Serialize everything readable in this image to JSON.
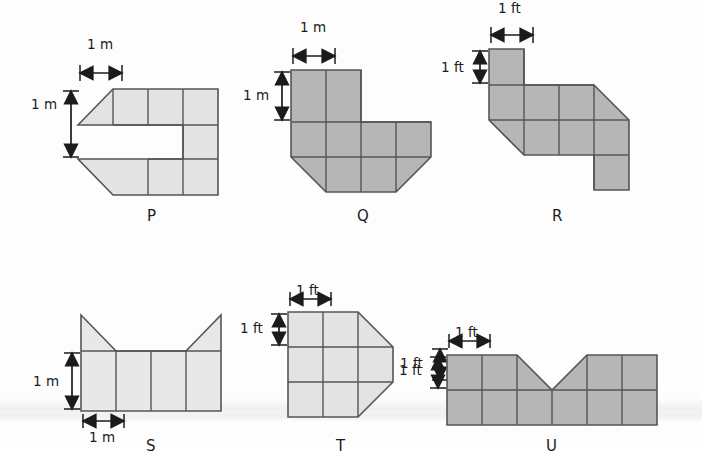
{
  "page": {
    "kind": "geometry-worksheet-figure",
    "background_color": "#fdfdfd",
    "fill_light": "#e3e3e3",
    "fill_dark": "#b6b6b6",
    "stroke_color": "#555555",
    "text_color": "#1b1b1b"
  },
  "figures": [
    {
      "id": "P",
      "label": "P",
      "unit": "m",
      "fill": "#e3e3e3",
      "dimensions": [
        {
          "name": "width",
          "text": "1 m"
        },
        {
          "name": "height",
          "text": "1 m"
        }
      ],
      "description": "Z-shaped polyomino: top row of 3 squares with a right triangle on the left end, a middle row of 2 squares on the right, and a bottom row of 3 squares with a right triangle on the left end."
    },
    {
      "id": "Q",
      "label": "Q",
      "unit": "m",
      "fill": "#b6b6b6",
      "dimensions": [
        {
          "name": "width",
          "text": "1 m"
        },
        {
          "name": "height",
          "text": "1 m"
        }
      ],
      "description": "Top row of 2 squares, middle row of 4 squares, bottom row of 2 squares with corner triangles cut on both lower ends."
    },
    {
      "id": "R",
      "label": "R",
      "unit": "ft",
      "fill": "#b6b6b6",
      "dimensions": [
        {
          "name": "width",
          "text": "1 ft"
        },
        {
          "name": "height",
          "text": "1 ft"
        }
      ],
      "description": "One square at top left, a row of 3 squares with a triangle on the right, a third row of 3 squares with a triangle cut at the left, and one square hanging below at the right."
    },
    {
      "id": "S",
      "label": "S",
      "unit": "m",
      "fill": "#e3e3e3",
      "dimensions": [
        {
          "name": "height",
          "text": "1 m"
        },
        {
          "name": "width",
          "text": "1 m"
        }
      ],
      "description": "A row of 4 squares with a right triangle pointing up on the first square and a right triangle pointing up on the last square."
    },
    {
      "id": "T",
      "label": "T",
      "unit": "ft",
      "fill": "#e3e3e3",
      "dimensions": [
        {
          "name": "width",
          "text": "1 ft"
        },
        {
          "name": "height",
          "text": "1 ft"
        },
        {
          "name": "right",
          "text": "1 ft"
        }
      ],
      "description": "A 3 by 3 grid of squares whose right edge bulges outward into a point across the middle row."
    },
    {
      "id": "U",
      "label": "U",
      "unit": "ft",
      "fill": "#b6b6b6",
      "dimensions": [
        {
          "name": "width",
          "text": "1 ft"
        },
        {
          "name": "height",
          "text": "1 ft"
        }
      ],
      "description": "Two rows of 6 squares with a V shaped notch cut from the top row spanning the middle columns."
    }
  ]
}
